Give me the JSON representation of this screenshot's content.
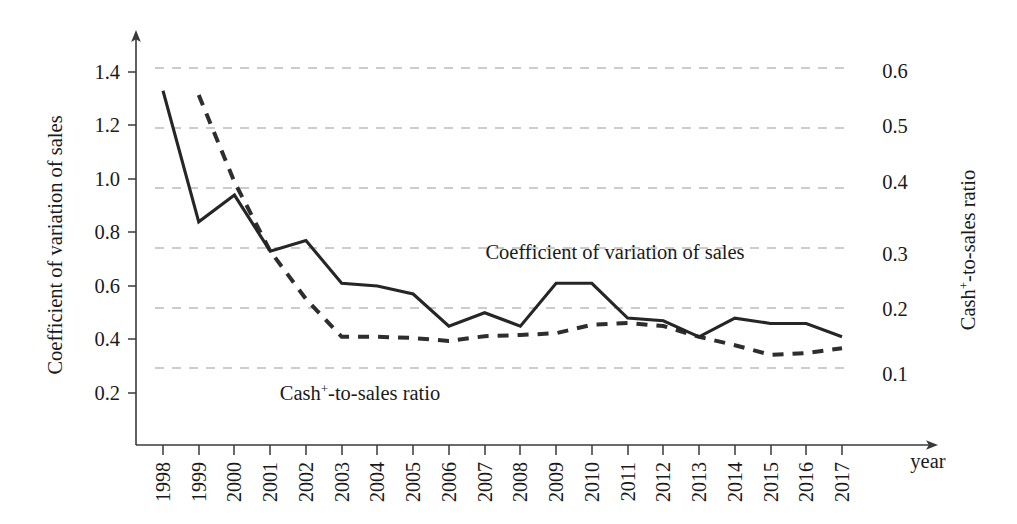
{
  "chart_data": {
    "type": "line",
    "title": "",
    "subtitle": "",
    "xlabel": "year",
    "ylabel": "Coefficient of variation of sales",
    "y2label": "Cash⁺-to-sales ratio",
    "x": [
      1998,
      1999,
      2000,
      2001,
      2002,
      2003,
      2004,
      2005,
      2006,
      2007,
      2008,
      2009,
      2010,
      2011,
      2012,
      2013,
      2014,
      2015,
      2016,
      2017
    ],
    "xtick_labels": [
      "1998",
      "1999",
      "2000",
      "2001",
      "2002",
      "2003",
      "2004",
      "2005",
      "2006",
      "2007",
      "2008",
      "2009",
      "2010",
      "2011",
      "2012",
      "2013",
      "2014",
      "2015",
      "2016",
      "2017"
    ],
    "ytick_labels": [
      "0.2",
      "0.4",
      "0.6",
      "0.8",
      "1.0",
      "1.2",
      "1.4"
    ],
    "ytick_values": [
      0.2,
      0.4,
      0.6,
      0.8,
      1.0,
      1.2,
      1.4
    ],
    "ylim": [
      0.08,
      1.48
    ],
    "y2tick_labels": [
      "0.1",
      "0.2",
      "0.3",
      "0.4",
      "0.5",
      "0.6"
    ],
    "y2tick_values": [
      0.1,
      0.2,
      0.3,
      0.4,
      0.5,
      0.6
    ],
    "y2lim": [
      0.016,
      0.625
    ],
    "grid": "horizontal-dashed-right-axis",
    "legend": "inline-annotations",
    "series": [
      {
        "name": "Coefficient of variation of sales",
        "axis": "left",
        "style": "solid",
        "color": "#262626",
        "values": [
          1.33,
          0.84,
          0.94,
          0.73,
          0.77,
          0.61,
          0.6,
          0.57,
          0.45,
          0.5,
          0.45,
          0.61,
          0.61,
          0.48,
          0.47,
          0.41,
          0.48,
          0.46,
          0.46,
          0.41
        ]
      },
      {
        "name": "Cash⁺-to-sales ratio",
        "axis": "right",
        "style": "dashed",
        "color": "#2e2e2e",
        "values": [
          null,
          0.555,
          0.41,
          0.295,
          0.215,
          0.152,
          0.152,
          0.15,
          0.145,
          0.153,
          0.155,
          0.158,
          0.172,
          0.175,
          0.17,
          0.152,
          0.138,
          0.122,
          0.125,
          0.133
        ]
      }
    ],
    "annotations": [
      {
        "name": "solid-series-label",
        "text": "Coefficient of variation of sales",
        "x": 615,
        "y": 257
      },
      {
        "name": "dashed-series-label",
        "text": "Cash⁺-to-sales ratio",
        "x": 360,
        "y": 399
      }
    ]
  },
  "axis": {
    "y_left_title": "Coefficient of variation of sales",
    "y_right_title": "Cash⁺-to-sales ratio",
    "x_title": "year",
    "cash_prefix": "Cash",
    "cash_sup": "+",
    "cash_suffix": "-to-sales ratio"
  }
}
